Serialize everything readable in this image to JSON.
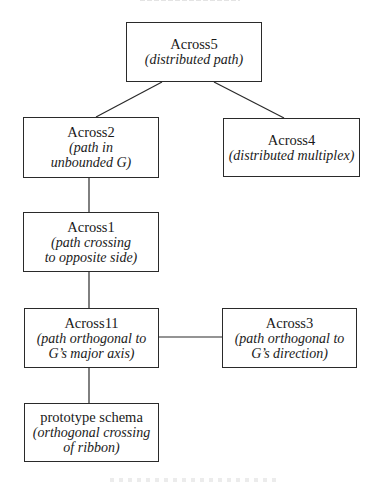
{
  "diagram": {
    "type": "tree",
    "line_color": "#2a2a2a",
    "nodes": [
      {
        "id": "across5",
        "title": "Across5",
        "desc": "(distributed path)",
        "desc_lines": [
          "(distributed path)"
        ],
        "box": [
          126,
          22,
          136,
          60
        ]
      },
      {
        "id": "across2",
        "title": "Across2",
        "desc": "(path in unbounded G)",
        "desc_lines": [
          "(path in",
          "unbounded G)"
        ],
        "box": [
          23,
          117,
          136,
          61
        ]
      },
      {
        "id": "across4",
        "title": "Across4",
        "desc": "(distributed multiplex)",
        "desc_lines": [
          "(distributed multiplex)"
        ],
        "box": [
          223,
          118,
          137,
          59
        ]
      },
      {
        "id": "across1",
        "title": "Across1",
        "desc": "(path crossing to opposite side)",
        "desc_lines": [
          "(path crossing",
          "to opposite side)"
        ],
        "box": [
          23,
          212,
          136,
          60
        ]
      },
      {
        "id": "across11",
        "title": "Across11",
        "desc": "(path orthogonal to G's major axis)",
        "desc_lines": [
          "(path orthogonal to",
          "G’s major axis)"
        ],
        "box": [
          24,
          308,
          135,
          60
        ]
      },
      {
        "id": "across3",
        "title": "Across3",
        "desc": "(path orthogonal to G's direction)",
        "desc_lines": [
          "(path orthogonal to",
          "G’s direction)"
        ],
        "box": [
          222,
          308,
          135,
          60
        ]
      },
      {
        "id": "prototype",
        "title": "prototype schema",
        "desc": "(orthogonal crossing of ribbon)",
        "desc_lines": [
          "(orthogonal crossing",
          "of ribbon)"
        ],
        "box": [
          24,
          403,
          135,
          59
        ]
      }
    ],
    "edges": [
      {
        "from": "across5",
        "to": "across2"
      },
      {
        "from": "across5",
        "to": "across4"
      },
      {
        "from": "across2",
        "to": "across1"
      },
      {
        "from": "across1",
        "to": "across11"
      },
      {
        "from": "across11",
        "to": "across3"
      },
      {
        "from": "across11",
        "to": "prototype"
      }
    ]
  }
}
